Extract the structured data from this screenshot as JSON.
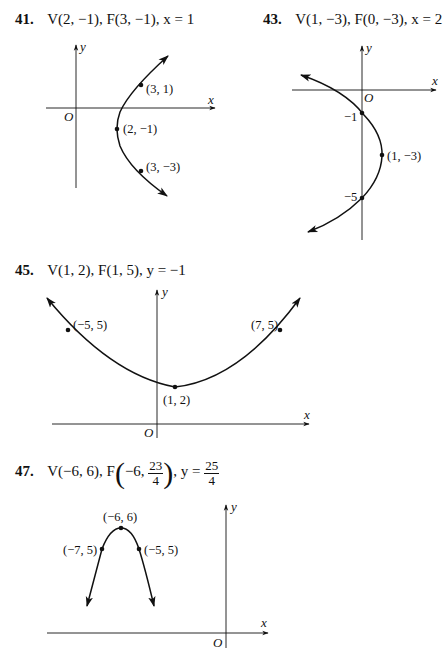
{
  "problems": [
    {
      "number": "41.",
      "vertex": "V(2, −1),",
      "focus": "F(3, −1),",
      "directrix": "x = 1",
      "axes": {
        "x": "x",
        "y": "y",
        "origin": "O"
      },
      "points": [
        {
          "label": "(3, 1)",
          "x": 3,
          "y": 1
        },
        {
          "label": "(2, −1)",
          "x": 2,
          "y": -1
        },
        {
          "label": "(3, −3)",
          "x": 3,
          "y": -3
        }
      ]
    },
    {
      "number": "43.",
      "vertex": "V(1, −3),",
      "focus": "F(0, −3),",
      "directrix": "x = 2",
      "axes": {
        "x": "x",
        "y": "y",
        "origin": "O"
      },
      "points": [
        {
          "label": "−1",
          "x": 0,
          "y": -1
        },
        {
          "label": "(1, −3)",
          "x": 1,
          "y": -3
        },
        {
          "label": "−5",
          "x": 0,
          "y": -5
        }
      ]
    },
    {
      "number": "45.",
      "vertex": "V(1, 2),",
      "focus": "F(1, 5),",
      "directrix": "y = −1",
      "axes": {
        "x": "x",
        "y": "y",
        "origin": "O"
      },
      "points": [
        {
          "label": "(−5, 5)",
          "x": -5,
          "y": 5
        },
        {
          "label": "(7, 5)",
          "x": 7,
          "y": 5
        },
        {
          "label": "(1, 2)",
          "x": 1,
          "y": 2
        }
      ]
    },
    {
      "number": "47.",
      "vertex": "V(−6, 6),",
      "focus_prefix": "F",
      "focus_x": "−6,",
      "focus_num": "23",
      "focus_den": "4",
      "directrix_prefix": "y =",
      "directrix_num": "25",
      "directrix_den": "4",
      "axes": {
        "x": "x",
        "y": "y",
        "origin": "O"
      },
      "points": [
        {
          "label": "(−6, 6)",
          "x": -6,
          "y": 6
        },
        {
          "label": "(−7, 5)",
          "x": -7,
          "y": 5
        },
        {
          "label": "(−5, 5)",
          "x": -5,
          "y": 5
        }
      ]
    }
  ]
}
